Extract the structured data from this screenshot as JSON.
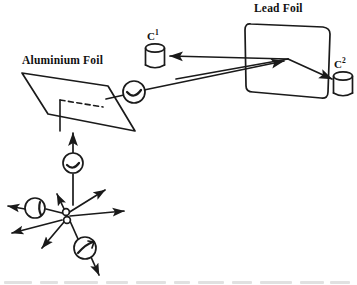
{
  "figure": {
    "type": "physics-scattering-apparatus-diagram",
    "background_color": "#ffffff",
    "ink_color": "#1a1a1a",
    "width": 357,
    "height": 285
  },
  "labels": {
    "aluminium_foil": "Aluminium Foil",
    "lead_foil": "Lead Foil",
    "counter_1_base": "C",
    "counter_1_sup": "1",
    "counter_2_base": "C",
    "counter_2_sup": "2"
  },
  "components": {
    "source": {
      "name": "radioactive-source",
      "x": 66,
      "y": 215
    },
    "aluminium_foil": {
      "name": "aluminium-foil",
      "shape": "parallelogram",
      "points": "22,73 108,86 135,131 48,114"
    },
    "lead_foil": {
      "name": "lead-foil",
      "shape": "rounded-parallelogram",
      "points": "245,22 330,28 325,98 249,91"
    },
    "counter_1": {
      "name": "counter-c1",
      "shape": "cylinder",
      "x": 146,
      "y": 44,
      "width": 18,
      "height": 24
    },
    "counter_2": {
      "name": "counter-c2",
      "shape": "cylinder",
      "x": 334,
      "y": 72,
      "width": 18,
      "height": 24
    }
  },
  "markers": [
    {
      "name": "beam-marker-source-to-foil",
      "x": 74,
      "y": 163,
      "r": 10
    },
    {
      "name": "beam-marker-foil-to-lead",
      "x": 134,
      "y": 92,
      "r": 11
    },
    {
      "name": "ray-marker-left",
      "x": 35,
      "y": 209,
      "r": 10
    },
    {
      "name": "ray-marker-lower-right",
      "x": 85,
      "y": 248,
      "r": 11
    }
  ],
  "beams": [
    {
      "name": "beam-source-to-aluminium-foil",
      "from": "radioactive-source",
      "to": "aluminium-foil"
    },
    {
      "name": "beam-aluminium-foil-to-lead-foil",
      "from": "aluminium-foil",
      "to": "lead-foil"
    },
    {
      "name": "beam-lead-foil-to-counter-c1",
      "from": "lead-foil",
      "to": "counter-c1"
    },
    {
      "name": "beam-lead-foil-to-counter-c2",
      "from": "lead-foil",
      "to": "counter-c2"
    }
  ],
  "emission_rays": [
    {
      "name": "ray-up-left",
      "angle_deg": 250
    },
    {
      "name": "ray-up-right",
      "angle_deg": 305
    },
    {
      "name": "ray-right",
      "angle_deg": 353
    },
    {
      "name": "ray-left-upper",
      "angle_deg": 186
    },
    {
      "name": "ray-left-lower",
      "angle_deg": 196
    },
    {
      "name": "ray-down-left",
      "angle_deg": 125
    },
    {
      "name": "ray-down-right",
      "angle_deg": 70
    },
    {
      "name": "ray-down",
      "angle_deg": 95
    }
  ]
}
